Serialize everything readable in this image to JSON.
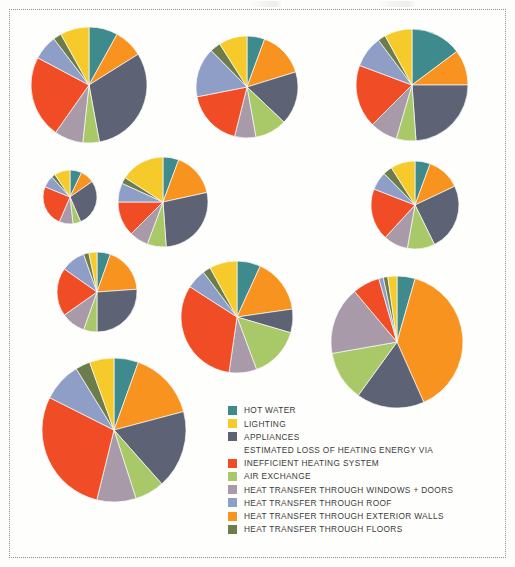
{
  "figure": {
    "background": "#fdfdfb",
    "frame_style": "dotted-border"
  },
  "palette": {
    "hot_water": "#3f8a8c",
    "lighting": "#f6ca2a",
    "appliances": "#5d6275",
    "inefficient_heating_system": "#f04d26",
    "air_exchange": "#a9c868",
    "windows_doors": "#a89aa8",
    "roof": "#8e9ec7",
    "exterior_walls": "#f7931e",
    "floors": "#6c7d4b"
  },
  "legend": {
    "heading": "ESTIMATED LOSS OF HEATING ENERGY VIA",
    "top_items": [
      {
        "label": "HOT WATER",
        "color_key": "hot_water"
      },
      {
        "label": "LIGHTING",
        "color_key": "lighting"
      },
      {
        "label": "APPLIANCES",
        "color_key": "appliances"
      }
    ],
    "loss_items": [
      {
        "label": "INEFFICIENT HEATING SYSTEM",
        "color_key": "inefficient_heating_system"
      },
      {
        "label": "AIR EXCHANGE",
        "color_key": "air_exchange"
      },
      {
        "label": "HEAT TRANSFER THROUGH WINDOWS + DOORS",
        "color_key": "windows_doors"
      },
      {
        "label": "HEAT TRANSFER THROUGH ROOF",
        "color_key": "roof"
      },
      {
        "label": "HEAT TRANSFER THROUGH EXTERIOR WALLS",
        "color_key": "exterior_walls"
      },
      {
        "label": "HEAT TRANSFER THROUGH FLOORS",
        "color_key": "floors"
      }
    ]
  },
  "chart_data": {
    "type": "pie",
    "title": "",
    "subtitle": "",
    "xlabel": "",
    "ylabel": "",
    "legend_position": "bottom-center",
    "grid": false,
    "categories": [
      "HOT WATER",
      "HEAT TRANSFER THROUGH EXTERIOR WALLS",
      "APPLIANCES",
      "AIR EXCHANGE",
      "HEAT TRANSFER THROUGH WINDOWS + DOORS",
      "INEFFICIENT HEATING SYSTEM",
      "HEAT TRANSFER THROUGH ROOF",
      "HEAT TRANSFER THROUGH FLOORS",
      "LIGHTING"
    ],
    "category_colors": [
      "#3f8a8c",
      "#f7931e",
      "#5d6275",
      "#a9c868",
      "#a89aa8",
      "#f04d26",
      "#8e9ec7",
      "#6c7d4b",
      "#f6ca2a"
    ],
    "series": [
      {
        "name": "pie-1",
        "cx": 89,
        "cy": 85,
        "r": 58,
        "values": [
          7,
          7,
          27,
          4,
          7,
          20,
          6,
          2,
          7
        ]
      },
      {
        "name": "pie-2",
        "cx": 247,
        "cy": 87,
        "r": 51,
        "values": [
          5,
          13,
          15,
          9,
          6,
          16,
          14,
          3,
          8
        ]
      },
      {
        "name": "pie-3",
        "cx": 412,
        "cy": 85,
        "r": 56,
        "values": [
          13,
          9,
          21,
          5,
          7,
          16,
          8,
          2,
          7
        ]
      },
      {
        "name": "pie-4",
        "cx": 70,
        "cy": 197,
        "r": 27,
        "values": [
          6,
          7,
          24,
          4,
          7,
          21,
          6,
          2,
          8
        ]
      },
      {
        "name": "pie-5",
        "cx": 163,
        "cy": 202,
        "r": 45,
        "values": [
          5,
          14,
          24,
          6,
          6,
          11,
          6,
          2,
          14
        ]
      },
      {
        "name": "pie-6",
        "cx": 415,
        "cy": 205,
        "r": 44,
        "values": [
          5,
          11,
          22,
          9,
          8,
          17,
          6,
          3,
          8
        ]
      },
      {
        "name": "pie-7",
        "cx": 97,
        "cy": 292,
        "r": 40,
        "values": [
          5,
          17,
          24,
          5,
          9,
          18,
          9,
          2,
          3
        ]
      },
      {
        "name": "pie-8",
        "cx": 237,
        "cy": 317,
        "r": 56,
        "values": [
          6,
          14,
          6,
          13,
          7,
          28,
          5,
          2,
          7
        ]
      },
      {
        "name": "pie-9",
        "cx": 397,
        "cy": 342,
        "r": 66,
        "values": [
          4,
          35,
          15,
          11,
          15,
          6,
          1,
          1,
          2
        ]
      },
      {
        "name": "pie-10",
        "cx": 114,
        "cy": 430,
        "r": 72,
        "values": [
          5,
          14,
          16,
          6,
          8,
          26,
          8,
          3,
          5
        ]
      }
    ]
  }
}
